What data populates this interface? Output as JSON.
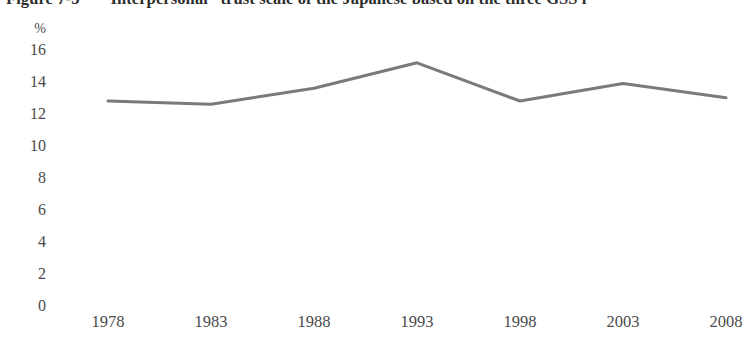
{
  "caption": {
    "label": "Figure 7-3",
    "text": "“Interpersonal” trust scale of the Japanese based on the three GSS i"
  },
  "axis": {
    "y_unit": "%",
    "y_ticks": [
      "16",
      "14",
      "12",
      "10",
      "8",
      "6",
      "4",
      "2",
      "0"
    ],
    "x_ticks": [
      "1978",
      "1983",
      "1988",
      "1993",
      "1998",
      "2003",
      "2008"
    ]
  },
  "style": {
    "line_color": "#7a7a7a",
    "text_color": "#4a4a4a",
    "background": "#ffffff"
  },
  "chart_data": {
    "type": "line",
    "title": "“Interpersonal” trust scale of the Japanese based on the three GSS i",
    "xlabel": "",
    "ylabel": "%",
    "x": [
      1978,
      1983,
      1988,
      1993,
      1998,
      2003,
      2008
    ],
    "categories": [
      "1978",
      "1983",
      "1988",
      "1993",
      "1998",
      "2003",
      "2008"
    ],
    "values": [
      12.8,
      12.6,
      13.6,
      15.2,
      12.8,
      13.9,
      13.0
    ],
    "series": [
      {
        "name": "Interpersonal trust scale",
        "values": [
          12.8,
          12.6,
          13.6,
          15.2,
          12.8,
          13.9,
          13.0
        ]
      }
    ],
    "ylim": [
      0,
      16
    ],
    "ytick_values": [
      16,
      14,
      12,
      10,
      8,
      6,
      4,
      2,
      0
    ],
    "grid": false,
    "legend": "none",
    "line_color": "#7a7a7a"
  }
}
